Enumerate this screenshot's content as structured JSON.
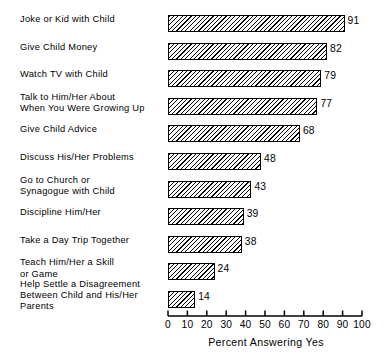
{
  "chart_data": {
    "type": "bar",
    "orientation": "horizontal",
    "title": "",
    "xlabel": "Percent Answering Yes",
    "ylabel": "",
    "xlim": [
      0,
      100
    ],
    "xticks": [
      0,
      10,
      20,
      30,
      40,
      50,
      60,
      70,
      80,
      90,
      100
    ],
    "xtick_labels": [
      "0",
      "10",
      "20",
      "30",
      "40",
      "50",
      "60",
      "70",
      "80",
      "90",
      "100"
    ],
    "grid": false,
    "legend": false,
    "bar_fill": "diagonal-hatch",
    "categories": [
      "Joke or Kid with Child",
      "Give Child Money",
      "Watch TV with Child",
      "Talk to Him/Her About\nWhen You Were Growing Up",
      "Give Child Advice",
      "Discuss His/Her Problems",
      "Go to Church or\nSynagogue with Child",
      "Discipline Him/Her",
      "Take a Day Trip Together",
      "Teach Him/Her a Skill\nor Game",
      "Help Settle a Disagreement\nBetween Child and His/Her\nParents"
    ],
    "values": [
      91,
      82,
      79,
      77,
      68,
      48,
      43,
      39,
      38,
      24,
      14
    ],
    "value_labels": [
      "91",
      "82",
      "79",
      "77",
      "68",
      "48",
      "43",
      "39",
      "38",
      "24",
      "14"
    ]
  },
  "colors": {
    "ink": "#000000",
    "background": "#ffffff"
  }
}
